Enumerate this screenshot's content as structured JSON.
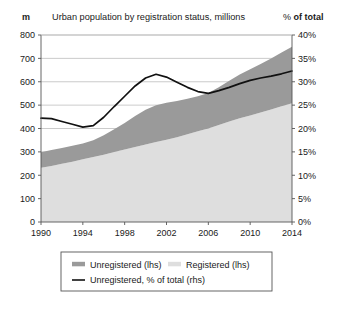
{
  "header": {
    "left_axis_unit": "m",
    "title": "Urban population by registration status, millions",
    "right_axis_unit_sym": "%",
    "right_axis_unit_rest": " of total"
  },
  "legend": {
    "items": [
      {
        "label": "Unregistered (lhs)",
        "marker": "swatch",
        "color": "#9a9a9a"
      },
      {
        "label": "Registered (lhs)",
        "marker": "swatch",
        "color": "#dedede"
      },
      {
        "label": "Unregistered, % of total (rhs)",
        "marker": "line",
        "color": "#111111"
      }
    ]
  },
  "chart_data": {
    "type": "area",
    "title": "Urban population by registration status, millions",
    "xlabel": "",
    "ylabel": "m",
    "y2label": "% of total",
    "grid": true,
    "legend_position": "bottom",
    "stacked": true,
    "x": [
      1990,
      1991,
      1992,
      1993,
      1994,
      1995,
      1996,
      1997,
      1998,
      1999,
      2000,
      2001,
      2002,
      2003,
      2004,
      2005,
      2006,
      2007,
      2008,
      2009,
      2010,
      2011,
      2012,
      2013,
      2014
    ],
    "xticks": [
      1990,
      1994,
      1998,
      2002,
      2006,
      2010,
      2014
    ],
    "xlim": [
      1990,
      2014
    ],
    "ylim": [
      0,
      800
    ],
    "yticks": [
      0,
      100,
      200,
      300,
      400,
      500,
      600,
      700,
      800
    ],
    "y2lim": [
      0,
      40
    ],
    "y2ticks": [
      "0%",
      "5%",
      "10%",
      "15%",
      "20%",
      "25%",
      "30%",
      "35%",
      "40%"
    ],
    "series": [
      {
        "name": "Registered (lhs)",
        "axis": "left",
        "color": "#dedede",
        "values": [
          232,
          240,
          249,
          258,
          268,
          278,
          288,
          299,
          310,
          321,
          332,
          342,
          352,
          363,
          375,
          388,
          400,
          415,
          430,
          444,
          456,
          468,
          481,
          495,
          508
        ]
      },
      {
        "name": "Unregistered (lhs)",
        "axis": "left",
        "color": "#9a9a9a",
        "values": [
          66,
          68,
          68,
          68,
          68,
          72,
          83,
          98,
          114,
          132,
          148,
          158,
          158,
          155,
          152,
          150,
          152,
          162,
          174,
          187,
          198,
          208,
          218,
          230,
          242
        ]
      }
    ],
    "line_series": {
      "name": "Unregistered, % of total (rhs)",
      "axis": "right",
      "color": "#111111",
      "unit": "%",
      "values": [
        22.2,
        22.1,
        21.5,
        20.9,
        20.3,
        20.6,
        22.4,
        24.7,
        26.9,
        29.1,
        30.8,
        31.6,
        31.0,
        29.9,
        28.8,
        27.9,
        27.5,
        28.1,
        28.8,
        29.6,
        30.3,
        30.8,
        31.2,
        31.7,
        32.3
      ]
    }
  }
}
